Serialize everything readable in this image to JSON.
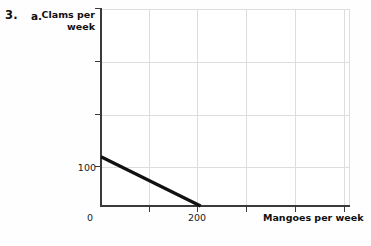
{
  "exercise": {
    "number": "3.",
    "part": "a."
  },
  "chart_data": {
    "type": "line",
    "title": "",
    "xlabel": "Mangoes per week",
    "ylabel": "Clams per week",
    "ylabel_lines": [
      "Clams per",
      "week"
    ],
    "x": [
      0,
      200
    ],
    "y": [
      100,
      0
    ],
    "series": [
      {
        "name": "budget-line",
        "values": [
          100,
          0
        ],
        "color": "#111111"
      }
    ],
    "xlim": [
      0,
      500
    ],
    "ylim": [
      0,
      400
    ],
    "xticks": [
      0,
      100,
      200,
      300,
      400,
      500
    ],
    "xtick_labels": [
      "0",
      "",
      "200",
      "",
      "",
      ""
    ],
    "yticks": [
      0,
      100,
      200,
      300,
      400
    ],
    "ytick_labels": [
      "",
      "100",
      "",
      "",
      ""
    ],
    "grid": true,
    "grid_color": "#dddddd",
    "axis_color": "#3a3a3a",
    "legend": "none"
  },
  "axis_labels": {
    "y_100": "100",
    "x_0": "0",
    "x_200": "200"
  }
}
